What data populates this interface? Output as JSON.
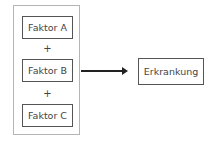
{
  "diagram": {
    "factors": [
      {
        "label": "Faktor A"
      },
      {
        "label": "Faktor B"
      },
      {
        "label": "Faktor C"
      }
    ],
    "operators": [
      "+",
      "+"
    ],
    "result": {
      "label": "Erkrankung"
    },
    "colors": {
      "box_border": "#555555",
      "outer_border": "#b5b5b5",
      "arrow": "#222222"
    }
  }
}
